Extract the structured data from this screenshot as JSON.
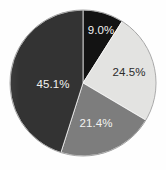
{
  "chart_data": {
    "type": "pie",
    "title": "",
    "subtitle": "",
    "xlabel": "",
    "ylabel": "",
    "legend_position": "none",
    "grid": false,
    "start_angle_deg": 0,
    "direction": "clockwise",
    "categories": [
      "Segment 1",
      "Segment 2",
      "Segment 3",
      "Segment 4"
    ],
    "values": [
      9.0,
      24.5,
      21.4,
      45.1
    ],
    "labels": [
      "9.0%",
      "24.5%",
      "21.4%",
      "45.1%"
    ],
    "colors": [
      "#131313",
      "#e3e3e1",
      "#7d7d7d",
      "#333333"
    ],
    "label_colors": [
      "#f2f2f0",
      "#2b2b2b",
      "#f2f2f0",
      "#f2f2f0"
    ],
    "slices": [
      {
        "label": "9.0%",
        "value": 9.0,
        "color": "#131313",
        "label_color": "#f2f2f0"
      },
      {
        "label": "24.5%",
        "value": 24.5,
        "color": "#e3e3e1",
        "label_color": "#2b2b2b"
      },
      {
        "label": "21.4%",
        "value": 21.4,
        "color": "#7d7d7d",
        "label_color": "#f2f2f0"
      },
      {
        "label": "45.1%",
        "value": 45.1,
        "color": "#333333",
        "label_color": "#f2f2f0"
      }
    ]
  },
  "figure": {
    "background_color": "#ffffff",
    "outline_color": "#9a9a9a",
    "center_x": 83,
    "center_y": 83,
    "radius": 73
  }
}
